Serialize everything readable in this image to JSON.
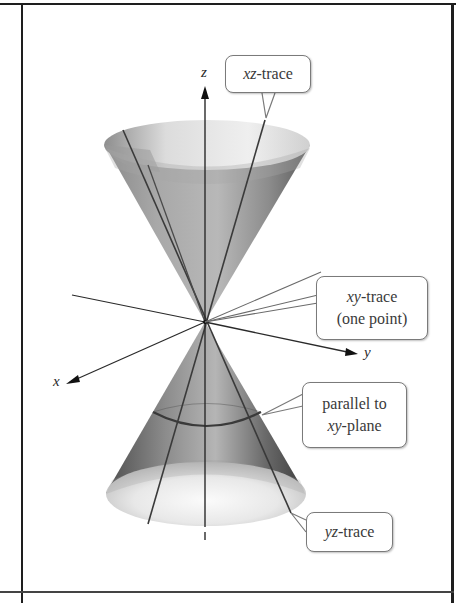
{
  "figure": {
    "type": "double-cone surface with traces",
    "axes": {
      "x_label": "x",
      "y_label": "y",
      "z_label": "z"
    },
    "callouts": {
      "xz_trace": {
        "italic": "xz",
        "rest": "-trace"
      },
      "xy_trace": {
        "italic": "xy",
        "rest": "-trace",
        "line2": "(one point)"
      },
      "parallel": {
        "line1": "parallel to",
        "italic": "xy",
        "rest": "-plane"
      },
      "yz_trace": {
        "italic": "yz",
        "rest": "-trace"
      }
    },
    "colors": {
      "frame": "#1e1e1e",
      "cone_dark": "#4a4a4a",
      "cone_mid": "#8c8c8c",
      "cone_light": "#e6e6e6",
      "trace_line": "#3c3c3c",
      "callout_border": "#7a7a7a"
    }
  }
}
